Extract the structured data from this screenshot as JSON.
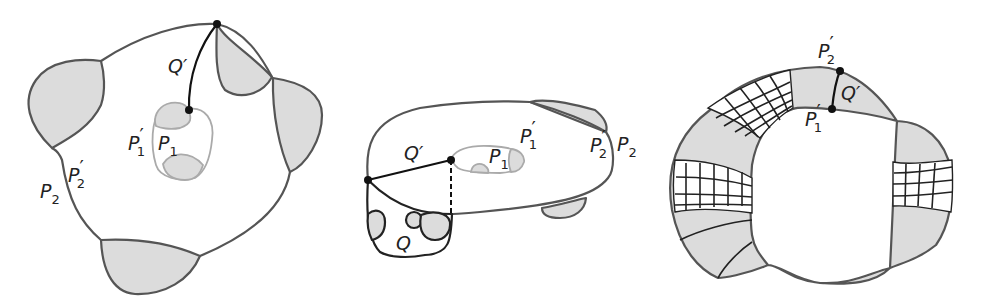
{
  "figure": {
    "panels": [
      {
        "id": "panel-1",
        "labels": {
          "q_prime": "Q′",
          "p1_prime": "P",
          "p1_prime_sub": "1",
          "p1_prime_mark": "′",
          "p1": "P",
          "p1_sub": "1",
          "p2": "P",
          "p2_sub": "2",
          "p2_prime": "P",
          "p2_prime_sub": "2",
          "p2_prime_mark": "′"
        }
      },
      {
        "id": "panel-2",
        "labels": {
          "q_prime": "Q′",
          "q": "Q",
          "p1": "P",
          "p1_sub": "1",
          "p1_prime": "P",
          "p1_prime_sub": "1",
          "p1_prime_mark": "′",
          "p2_prime": "P",
          "p2_prime_sub": "2",
          "p2_prime_mark": "′",
          "p2": "P",
          "p2_sub": "2"
        }
      },
      {
        "id": "panel-3",
        "labels": {
          "p2_prime": "P",
          "p2_prime_sub": "2",
          "p2_prime_mark": "′",
          "q_prime": "Q′",
          "p1_prime": "P",
          "p1_prime_sub": "1",
          "p1_prime_mark": "′"
        }
      }
    ],
    "colors": {
      "shade": "#dcdcdc",
      "outline": "#555555",
      "hole_outline": "#aaaaaa",
      "path": "#111111"
    }
  }
}
